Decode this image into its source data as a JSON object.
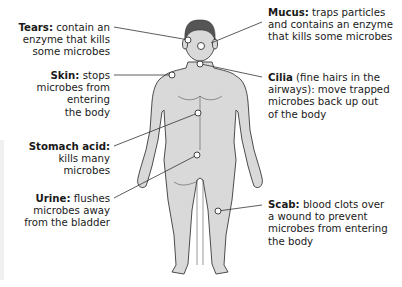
{
  "diagram": {
    "colors": {
      "body_fill": "#d9d9d9",
      "outline": "#3a3a3a",
      "hair": "#555555",
      "line": "#333333",
      "marker_fill": "#ffffff"
    },
    "labels": [
      {
        "id": "tears",
        "term": "Tears:",
        "lines": [
          "contain an",
          "enzyme that kills",
          "some microbes"
        ]
      },
      {
        "id": "skin",
        "term": "Skin:",
        "lines": [
          "stops",
          "microbes from",
          "entering",
          "the body"
        ]
      },
      {
        "id": "stomach",
        "term": "Stomach acid:",
        "lines": [
          "kills many",
          "microbes"
        ]
      },
      {
        "id": "urine",
        "term": "Urine:",
        "lines": [
          "flushes",
          "microbes away",
          "from the bladder"
        ]
      },
      {
        "id": "mucus",
        "term": "Mucus:",
        "lines": [
          "traps particles",
          "and contains an enzyme",
          "that kills some microbes"
        ]
      },
      {
        "id": "cilia",
        "term": "Cilia",
        "lines": [
          "(fine hairs in the",
          "airways): move trapped",
          "microbes back up out",
          "of the body"
        ]
      },
      {
        "id": "scab",
        "term": "Scab:",
        "lines": [
          "blood clots over",
          "a wound to prevent",
          "microbes from entering",
          "the body"
        ]
      }
    ]
  }
}
